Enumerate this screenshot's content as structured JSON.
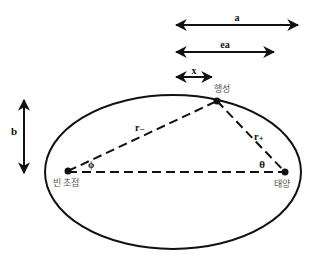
{
  "diagram": {
    "type": "ellipse-orbit",
    "labels": {
      "a": "a",
      "ea": "ea",
      "x": "x",
      "b": "b",
      "r_minus": "r₋",
      "r_plus": "r₊",
      "phi": "ϕ",
      "theta": "θ",
      "planet": "행성",
      "sun": "태양",
      "empty_focus": "빈 초점"
    },
    "colors": {
      "stroke": "#111111",
      "korean_label": "#555555",
      "background": "#ffffff"
    },
    "points": {
      "empty_focus": [
        68,
        171
      ],
      "sun": [
        285,
        172
      ],
      "planet": [
        217,
        101
      ]
    },
    "ellipse": {
      "cx": 173,
      "cy": 172,
      "rx": 128,
      "ry": 77
    }
  }
}
